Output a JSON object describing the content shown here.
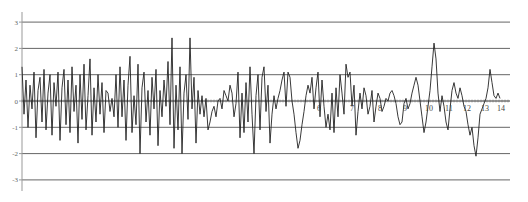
{
  "chart_data": {
    "type": "line",
    "title": "",
    "xlabel": "",
    "ylabel": "",
    "ylim": [
      -3,
      3
    ],
    "yticks": [
      "3",
      "2",
      "1",
      "0",
      "-1",
      "-2",
      "-3"
    ],
    "xtick_labels": [
      "6",
      "7",
      "8",
      "9",
      "10",
      "11",
      "12",
      "13",
      "14"
    ],
    "xtick_positions_px": [
      317,
      350,
      378,
      403,
      425,
      445,
      463,
      481,
      497
    ],
    "grid": true,
    "legend": null,
    "series": [
      {
        "name": "signal",
        "color": "#222222",
        "x_px": [
          22,
          24,
          26,
          28,
          30,
          32,
          34,
          36,
          38,
          40,
          42,
          44,
          46,
          48,
          50,
          52,
          54,
          56,
          58,
          60,
          62,
          64,
          66,
          68,
          70,
          72,
          74,
          76,
          78,
          80,
          82,
          84,
          86,
          88,
          90,
          92,
          94,
          96,
          98,
          100,
          102,
          104,
          106,
          108,
          110,
          112,
          114,
          116,
          118,
          120,
          122,
          124,
          126,
          128,
          130,
          132,
          134,
          136,
          138,
          140,
          142,
          144,
          146,
          148,
          150,
          152,
          154,
          156,
          158,
          160,
          162,
          164,
          166,
          168,
          170,
          172,
          174,
          176,
          178,
          180,
          182,
          184,
          186,
          188,
          190,
          192,
          194,
          196,
          198,
          200,
          202,
          204,
          206,
          208,
          210,
          212,
          214,
          216,
          218,
          220,
          222,
          224,
          226,
          228,
          230,
          232,
          234,
          236,
          238,
          240,
          242,
          244,
          246,
          248,
          250,
          252,
          254,
          256,
          258,
          260,
          262,
          264,
          266,
          268,
          270,
          272,
          274,
          276,
          278,
          280,
          282,
          284,
          286,
          288,
          290,
          292,
          294,
          296,
          298,
          300,
          302,
          304,
          306,
          308,
          310,
          312,
          314,
          316,
          318,
          320,
          322,
          324,
          326,
          328,
          330,
          332,
          334,
          336,
          338,
          340,
          342,
          344,
          346,
          348,
          350,
          352,
          354,
          356,
          358,
          360,
          362,
          364,
          366,
          368,
          370,
          372,
          374,
          376,
          378,
          380,
          382,
          384,
          386,
          388,
          390,
          392,
          394,
          396,
          398,
          400,
          402,
          404,
          406,
          408,
          410,
          412,
          414,
          416,
          418,
          420,
          422,
          424,
          426,
          428,
          430,
          432,
          434,
          436,
          438,
          440,
          442,
          444,
          446,
          448,
          450,
          452,
          454,
          456,
          458,
          460,
          462,
          464,
          466,
          468,
          470,
          472,
          474,
          476,
          478,
          480,
          482,
          484,
          486,
          488,
          490,
          492,
          494,
          496,
          498,
          500,
          502,
          504,
          506,
          508,
          510
        ],
        "values": [
          1.3,
          -0.5,
          0.8,
          -1.0,
          0.6,
          -0.3,
          1.1,
          -1.4,
          0.4,
          0.9,
          -0.8,
          1.2,
          -1.1,
          0.3,
          1.0,
          -1.3,
          0.7,
          -0.2,
          1.1,
          -1.5,
          0.5,
          1.2,
          -0.9,
          0.8,
          -1.2,
          1.3,
          -0.4,
          0.6,
          -1.6,
          1.0,
          -0.7,
          1.4,
          -1.1,
          0.2,
          1.6,
          -1.3,
          0.5,
          -0.8,
          1.0,
          -0.5,
          0.7,
          -1.2,
          0.4,
          0.3,
          -0.4,
          0.1,
          -0.6,
          1.0,
          -1.0,
          1.3,
          -0.6,
          0.8,
          -1.5,
          0.6,
          1.7,
          -1.2,
          0.2,
          -0.9,
          1.4,
          -2.0,
          0.5,
          1.1,
          -0.8,
          0.4,
          -1.3,
          0.9,
          -0.3,
          1.2,
          -1.7,
          0.4,
          -0.6,
          0.8,
          -0.2,
          1.5,
          -0.9,
          2.4,
          -1.8,
          0.6,
          -1.1,
          1.3,
          -2.0,
          0.3,
          1.0,
          -0.7,
          2.4,
          -0.3,
          0.9,
          -1.6,
          0.4,
          -0.5,
          0.2,
          -0.6,
          0.1,
          -1.1,
          -0.8,
          -0.4,
          -0.2,
          -0.6,
          0.0,
          0.1,
          -0.3,
          0.4,
          0.2,
          0.0,
          0.6,
          0.3,
          -0.6,
          -0.1,
          1.1,
          -1.4,
          0.3,
          -1.2,
          0.7,
          -0.8,
          1.3,
          -0.5,
          -2.0,
          0.2,
          1.0,
          -1.1,
          0.9,
          1.3,
          -0.4,
          0.6,
          -1.6,
          -0.5,
          0.2,
          -0.3,
          0.1,
          0.4,
          0.8,
          1.1,
          -0.2,
          1.1,
          0.9,
          0.0,
          -0.5,
          -1.2,
          -1.8,
          -1.5,
          -0.9,
          -0.4,
          0.2,
          0.6,
          0.3,
          0.9,
          -0.3,
          0.5,
          1.1,
          -0.6,
          0.8,
          -0.2,
          -1.0,
          -0.5,
          -1.1,
          0.3,
          -1.2,
          0.5,
          -0.6,
          1.0,
          0.3,
          -0.5,
          1.4,
          0.9,
          1.1,
          -0.2,
          0.6,
          -1.3,
          -0.4,
          0.3,
          -0.3,
          0.5,
          0.2,
          -0.5,
          -0.2,
          0.4,
          -0.8,
          -0.2,
          0.3,
          0.1,
          -0.4,
          -0.2,
          0.1,
          0.0,
          0.3,
          0.4,
          0.2,
          -0.1,
          -0.6,
          -0.9,
          -0.8,
          -0.1,
          0.1,
          -0.3,
          -0.1,
          0.3,
          0.6,
          0.9,
          0.6,
          0.0,
          -0.6,
          -1.2,
          -0.8,
          -0.2,
          0.4,
          1.3,
          2.2,
          1.6,
          0.3,
          -0.4,
          0.2,
          -0.2,
          -0.8,
          -1.1,
          -0.3,
          0.4,
          0.7,
          0.3,
          0.1,
          0.5,
          0.2,
          -0.2,
          -0.4,
          -0.9,
          -1.3,
          -1.0,
          -1.7,
          -2.1,
          -1.4,
          -0.5,
          -0.3,
          -0.1,
          0.1,
          0.5,
          1.2,
          0.7,
          0.2,
          0.1,
          0.3,
          0.1
        ]
      }
    ]
  },
  "colors": {
    "gridline": "#555555",
    "axis": "#888888",
    "zero_line": "#333333",
    "background": "#ffffff"
  }
}
